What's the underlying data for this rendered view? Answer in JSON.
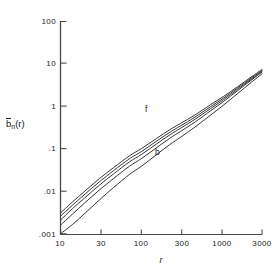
{
  "chart_data": {
    "type": "line",
    "title": "",
    "xlabel": "r",
    "ylabel": "b̄ₙ(r)",
    "xscale": "log",
    "yscale": "log",
    "xlim": [
      10,
      3000
    ],
    "ylim": [
      0.001,
      100
    ],
    "grid": false,
    "legend": "none",
    "xticks": [
      {
        "value": 10,
        "label": "10"
      },
      {
        "value": 30,
        "label": "30"
      },
      {
        "value": 100,
        "label": "100"
      },
      {
        "value": 300,
        "label": "300"
      },
      {
        "value": 1000,
        "label": "1000"
      },
      {
        "value": 3000,
        "label": "3000"
      }
    ],
    "yticks": [
      {
        "value": 100,
        "label": "100"
      },
      {
        "value": 10,
        "label": "10"
      },
      {
        "value": 1,
        "label": "1"
      },
      {
        "value": 0.1,
        "label": ".1"
      },
      {
        "value": 0.01,
        "label": ".01"
      },
      {
        "value": 0.001,
        "label": ".001"
      }
    ],
    "annotations": [
      {
        "text": "f",
        "x": 250,
        "y": 0.52
      },
      {
        "text": "b",
        "x": 330,
        "y": 0.075
      }
    ],
    "x": [
      10,
      14,
      20,
      30,
      45,
      70,
      100,
      150,
      220,
      300,
      450,
      700,
      1000,
      1500,
      2200,
      3000
    ],
    "series": [
      {
        "name": "curve-1-f",
        "label": "f",
        "values": [
          0.0031,
          0.0056,
          0.0102,
          0.0198,
          0.0363,
          0.068,
          0.103,
          0.174,
          0.282,
          0.4,
          0.63,
          1.1,
          1.7,
          2.9,
          4.9,
          7.4
        ]
      },
      {
        "name": "curve-2",
        "label": "",
        "values": [
          0.0026,
          0.0047,
          0.0086,
          0.0167,
          0.0308,
          0.058,
          0.088,
          0.15,
          0.245,
          0.35,
          0.56,
          0.99,
          1.55,
          2.7,
          4.6,
          7.0
        ]
      },
      {
        "name": "curve-3",
        "label": "",
        "values": [
          0.0021,
          0.0039,
          0.0071,
          0.0139,
          0.0258,
          0.049,
          0.075,
          0.129,
          0.213,
          0.307,
          0.498,
          0.89,
          1.42,
          2.52,
          4.35,
          6.7
        ]
      },
      {
        "name": "curve-4",
        "label": "",
        "values": [
          0.0016,
          0.0029,
          0.0054,
          0.0107,
          0.0201,
          0.0387,
          0.06,
          0.105,
          0.177,
          0.259,
          0.429,
          0.79,
          1.29,
          2.34,
          4.12,
          6.45
        ]
      },
      {
        "name": "curve-5-b",
        "label": "b",
        "values": [
          0.001,
          0.00165,
          0.00305,
          0.00625,
          0.0123,
          0.0248,
          0.0396,
          0.072,
          0.126,
          0.189,
          0.326,
          0.625,
          1.06,
          2.0,
          3.65,
          5.85
        ]
      }
    ]
  },
  "axes": {
    "x_title": "r",
    "y_title_base": "b",
    "y_title_sub": "n",
    "y_title_tail": "(r)"
  }
}
